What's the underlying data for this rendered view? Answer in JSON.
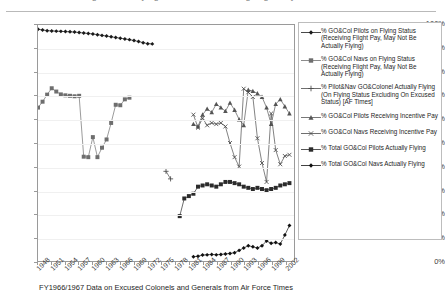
{
  "page": {
    "cutoff_header_text": "of Pilots and Navigators on Flying Status and Receiving Flight Pay"
  },
  "caption": "FY1966/1967 Data on Excused Colonels and Generals from Air Force Times",
  "legend": {
    "entries": [
      {
        "label": "% GO&Col Pilots on Flying Status (Receiving Flight Pay, May Not Be Actually Flying)",
        "marker": "diamond",
        "color": "#1a1a1a"
      },
      {
        "label": "% GO&Col Navs on Flying Status (Receiving Flight Pay, May Not Be Actually Flying)",
        "marker": "square",
        "color": "#6e6e6e"
      },
      {
        "label": "% Pilot&Nav GO&Colonel Actually Flying (On Flying Status Excluding On Excused Status) [AF Times]",
        "marker": "plus",
        "color": "#4a4a4a"
      },
      {
        "label": "% GO&Col Pilots Receiving Incentive Pay",
        "marker": "triangle",
        "color": "#555555"
      },
      {
        "label": "% GO&Col Navs Receiving Incentive Pay",
        "marker": "x",
        "color": "#4a4a4a"
      },
      {
        "label": "% Total GO&Col Pilots Actually Flying",
        "marker": "square",
        "color": "#2b2b2b"
      },
      {
        "label": "% Total GO&Col Navs Actually Flying",
        "marker": "diamond",
        "color": "#111111"
      }
    ]
  },
  "chart_data": {
    "type": "line",
    "title": "",
    "xlabel": "FY1966/1967 Data on Excused Colonels and Generals from Air Force Times",
    "ylabel": "",
    "ylim": [
      0,
      100
    ],
    "ytick_labels": [
      "0%",
      "10%",
      "20%",
      "30%",
      "40%",
      "50%",
      "60%",
      "70%",
      "80%",
      "90%",
      "100%"
    ],
    "ytick_values": [
      0,
      10,
      20,
      30,
      40,
      50,
      60,
      70,
      80,
      90,
      100
    ],
    "xlim": [
      1948,
      2004
    ],
    "xtick_labels": [
      "1948",
      "1951",
      "1954",
      "1957",
      "1960",
      "1963",
      "1966",
      "1969",
      "1972",
      "1975",
      "1978",
      "1981",
      "1984",
      "1987",
      "1990",
      "1993",
      "1996",
      "1999",
      "2002"
    ],
    "xtick_values": [
      1948,
      1951,
      1954,
      1957,
      1960,
      1963,
      1966,
      1969,
      1972,
      1975,
      1978,
      1981,
      1984,
      1987,
      1990,
      1993,
      1996,
      1999,
      2002
    ],
    "grid": true,
    "grid_axis": "y",
    "legend_position": "right",
    "series": [
      {
        "name": "% GO&Col Pilots on Flying Status (Receiving Flight Pay, May Not Be Actually Flying)",
        "marker": "diamond",
        "color": "#1a1a1a",
        "x": [
          1948,
          1949,
          1950,
          1951,
          1952,
          1953,
          1954,
          1955,
          1956,
          1957,
          1958,
          1959,
          1960,
          1961,
          1962,
          1963,
          1964,
          1965,
          1966,
          1967,
          1968,
          1969,
          1970,
          1971,
          1972,
          1973
        ],
        "values": [
          98.2,
          97.9,
          97.6,
          97.5,
          97.4,
          97.3,
          97.2,
          97.1,
          97.0,
          96.8,
          96.6,
          96.4,
          96.2,
          95.9,
          95.6,
          95.3,
          95.0,
          94.7,
          94.4,
          94.1,
          93.8,
          93.4,
          93.0,
          92.5,
          92.1,
          92.0
        ]
      },
      {
        "name": "% GO&Col Navs on Flying Status (Receiving Flight Pay, May Not Be Actually Flying)",
        "marker": "square",
        "color": "#6e6e6e",
        "x": [
          1948,
          1949,
          1950,
          1951,
          1952,
          1953,
          1954,
          1955,
          1956,
          1957,
          1958,
          1959,
          1960,
          1961,
          1962,
          1963,
          1964,
          1965,
          1966,
          1967,
          1968
        ],
        "values": [
          65.0,
          67.5,
          70.5,
          73.2,
          71.8,
          70.6,
          70.2,
          70.0,
          69.8,
          70.0,
          44.2,
          44.0,
          52.5,
          44.0,
          48.0,
          51.5,
          58.5,
          66.2,
          66.0,
          68.5,
          69.2
        ]
      },
      {
        "name": "% Pilot&Nav GO&Colonel Actually Flying (On Flying Status Excluding On Excused Status) [AF Times]",
        "marker": "plus",
        "color": "#4a4a4a",
        "x": [
          1976,
          1977
        ],
        "values": [
          38.0,
          34.8
        ]
      },
      {
        "name": "% GO&Col Pilots Receiving Incentive Pay",
        "marker": "triangle",
        "color": "#555555",
        "x": [
          1982,
          1983,
          1984,
          1985,
          1986,
          1987,
          1988,
          1989,
          1990,
          1991,
          1992,
          1993,
          1994,
          1995,
          1996,
          1997,
          1998,
          1999,
          2000,
          2001,
          2002,
          2003
        ],
        "values": [
          58.0,
          57.0,
          62.0,
          64.5,
          63.0,
          66.5,
          65.0,
          63.5,
          67.0,
          64.0,
          60.0,
          57.5,
          72.5,
          72.0,
          71.0,
          69.5,
          65.0,
          58.0,
          66.5,
          68.5,
          65.5,
          62.5
        ]
      },
      {
        "name": "% GO&Col Navs Receiving Incentive Pay",
        "marker": "x",
        "color": "#4a4a4a",
        "x": [
          1982,
          1983,
          1984,
          1985,
          1986,
          1987,
          1988,
          1989,
          1990,
          1991,
          1992,
          1993,
          1994,
          1995,
          1996,
          1997,
          1998,
          1999,
          2000,
          2001,
          2002,
          2003
        ],
        "values": [
          62.0,
          56.5,
          60.5,
          57.5,
          58.5,
          58.0,
          58.5,
          57.0,
          50.0,
          44.0,
          40.0,
          73.0,
          71.5,
          69.5,
          52.0,
          41.5,
          33.5,
          62.5,
          47.0,
          41.0,
          44.5,
          45.0
        ]
      },
      {
        "name": "% Total GO&Col Pilots Actually Flying",
        "marker": "square",
        "color": "#2b2b2b",
        "x": [
          1979,
          1980,
          1981,
          1982,
          1983,
          1984,
          1985,
          1986,
          1987,
          1988,
          1989,
          1990,
          1991,
          1992,
          1993,
          1994,
          1995,
          1996,
          1997,
          1998,
          1999,
          2000,
          2001,
          2002,
          2003
        ],
        "values": [
          19.0,
          26.5,
          27.5,
          28.5,
          31.5,
          32.0,
          32.5,
          32.0,
          31.5,
          32.5,
          33.5,
          33.5,
          33.0,
          32.5,
          31.5,
          31.0,
          30.5,
          31.0,
          30.5,
          30.0,
          30.5,
          31.0,
          32.0,
          32.5,
          33.0
        ]
      },
      {
        "name": "% Total GO&Col Navs Actually Flying",
        "marker": "diamond",
        "color": "#111111",
        "x": [
          1982,
          1983,
          1984,
          1985,
          1986,
          1987,
          1988,
          1989,
          1990,
          1991,
          1992,
          1993,
          1994,
          1995,
          1996,
          1997,
          1998,
          1999,
          2000,
          2001,
          2002,
          2003
        ],
        "values": [
          1.8,
          2.0,
          2.5,
          2.6,
          2.8,
          2.6,
          2.8,
          3.0,
          3.2,
          3.5,
          4.5,
          5.5,
          6.5,
          6.0,
          5.5,
          6.5,
          8.5,
          7.5,
          7.8,
          7.2,
          11.0,
          15.0
        ]
      }
    ]
  }
}
